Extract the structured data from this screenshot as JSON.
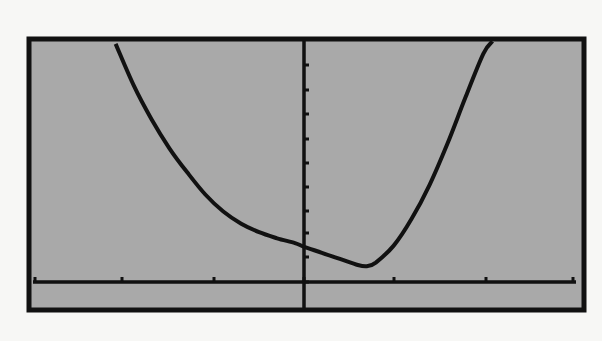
{
  "colors": {
    "page_bg": "#f7f7f5",
    "screen_bg": "#a9a9a9",
    "ink": "#111111"
  },
  "chart_data": {
    "type": "line",
    "title": "",
    "xlabel": "",
    "ylabel": "",
    "grid": false,
    "legend": null,
    "axes": {
      "x_ticks_pixel": [
        35,
        122,
        214,
        304,
        394,
        486,
        573
      ],
      "y_ticks_pixel": [
        65,
        90,
        114,
        139,
        163,
        187,
        211,
        233,
        257,
        282
      ],
      "x_tick_units": [
        -3,
        -2,
        -1,
        0,
        1,
        2,
        3
      ],
      "y_tick_units": [
        9,
        8,
        7,
        6,
        5,
        4,
        3,
        2,
        1,
        0
      ]
    },
    "series": [
      {
        "name": "y1",
        "x": [
          -2.1,
          -1.9,
          -1.7,
          -1.5,
          -1.3,
          -1.1,
          -0.9,
          -0.7,
          -0.5,
          -0.3,
          -0.1,
          0.0,
          0.2,
          0.4,
          0.6,
          0.7,
          0.8,
          1.0,
          1.2,
          1.4,
          1.6,
          1.8,
          2.0,
          2.1
        ],
        "y": [
          9.8,
          8.1,
          6.7,
          5.5,
          4.5,
          3.6,
          2.9,
          2.4,
          2.05,
          1.8,
          1.6,
          1.45,
          1.2,
          0.95,
          0.7,
          0.65,
          0.8,
          1.5,
          2.6,
          4.0,
          5.7,
          7.6,
          9.4,
          9.9
        ]
      }
    ]
  }
}
